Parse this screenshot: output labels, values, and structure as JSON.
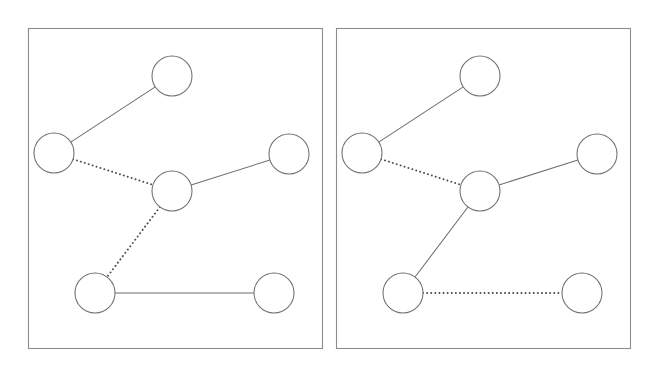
{
  "figure": {
    "background_color": "#ffffff",
    "width": 653,
    "height": 374,
    "node_radius": 20,
    "colors": {
      "frame_stroke": "#8c8c8c",
      "node_stroke": "#6e6e74",
      "node_fill": "#ffffff",
      "solid_edge": "#6e6e74",
      "dotted_edge": "#4a4a50"
    },
    "line_styles": {
      "solid": "solid",
      "dotted": "dotted"
    }
  },
  "panels": [
    {
      "id": "panel-left",
      "label": "left-panel",
      "frame": {
        "x": 28,
        "y": 28,
        "width": 294,
        "height": 320
      },
      "nodes": [
        {
          "id": "n-top",
          "label": "top-node",
          "cx": 172,
          "cy": 76,
          "r": 20
        },
        {
          "id": "n-left",
          "label": "left-node",
          "cx": 54,
          "cy": 153,
          "r": 20
        },
        {
          "id": "n-center",
          "label": "center-node",
          "cx": 172,
          "cy": 191,
          "r": 20
        },
        {
          "id": "n-right",
          "label": "right-node",
          "cx": 289,
          "cy": 154,
          "r": 20
        },
        {
          "id": "n-bottom-left",
          "label": "bottom-left-node",
          "cx": 95,
          "cy": 293,
          "r": 20
        },
        {
          "id": "n-bottom-right",
          "label": "bottom-right-node",
          "cx": 274,
          "cy": 293,
          "r": 20
        }
      ],
      "edges": [
        {
          "id": "e-left-top",
          "from": "n-left",
          "to": "n-top",
          "style": "solid"
        },
        {
          "id": "e-left-center",
          "from": "n-left",
          "to": "n-center",
          "style": "dotted"
        },
        {
          "id": "e-center-right",
          "from": "n-center",
          "to": "n-right",
          "style": "solid"
        },
        {
          "id": "e-center-bottomleft",
          "from": "n-center",
          "to": "n-bottom-left",
          "style": "dotted"
        },
        {
          "id": "e-bottomleft-bottomright",
          "from": "n-bottom-left",
          "to": "n-bottom-right",
          "style": "solid"
        }
      ]
    },
    {
      "id": "panel-right",
      "label": "right-panel",
      "frame": {
        "x": 336,
        "y": 28,
        "width": 294,
        "height": 320
      },
      "nodes": [
        {
          "id": "n-top",
          "label": "top-node",
          "cx": 480,
          "cy": 76,
          "r": 20
        },
        {
          "id": "n-left",
          "label": "left-node",
          "cx": 362,
          "cy": 153,
          "r": 20
        },
        {
          "id": "n-center",
          "label": "center-node",
          "cx": 480,
          "cy": 191,
          "r": 20
        },
        {
          "id": "n-right",
          "label": "right-node",
          "cx": 597,
          "cy": 154,
          "r": 20
        },
        {
          "id": "n-bottom-left",
          "label": "bottom-left-node",
          "cx": 403,
          "cy": 293,
          "r": 20
        },
        {
          "id": "n-bottom-right",
          "label": "bottom-right-node",
          "cx": 582,
          "cy": 293,
          "r": 20
        }
      ],
      "edges": [
        {
          "id": "e-left-top",
          "from": "n-left",
          "to": "n-top",
          "style": "solid"
        },
        {
          "id": "e-left-center",
          "from": "n-left",
          "to": "n-center",
          "style": "dotted"
        },
        {
          "id": "e-center-right",
          "from": "n-center",
          "to": "n-right",
          "style": "solid"
        },
        {
          "id": "e-center-bottomleft",
          "from": "n-center",
          "to": "n-bottom-left",
          "style": "solid"
        },
        {
          "id": "e-bottomleft-bottomright",
          "from": "n-bottom-left",
          "to": "n-bottom-right",
          "style": "dotted"
        }
      ]
    }
  ]
}
